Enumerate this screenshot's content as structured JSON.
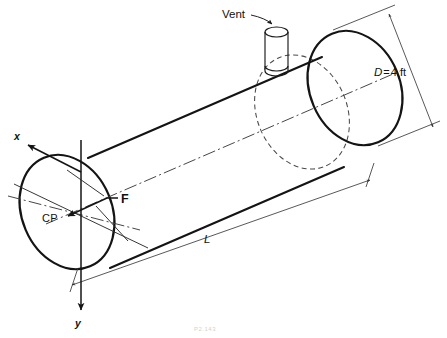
{
  "figure": {
    "kind": "engineering-diagram",
    "background_color": "#ffffff",
    "line_color": "#141414",
    "caption": "P2.143"
  },
  "labels": {
    "vent": "Vent",
    "diameter": "D=4 ft",
    "diameter_symbol": "D",
    "diameter_value": "4 ft",
    "length": "L",
    "center_of_pressure": "CP",
    "force": "F",
    "axis_x": "x",
    "axis_y": "y"
  },
  "annotations": [
    {
      "name": "vent",
      "text": "Vent",
      "kind": "leader-label"
    },
    {
      "name": "diameter-dimension",
      "text": "D=4 ft",
      "kind": "dimension"
    },
    {
      "name": "length-dimension",
      "text": "L",
      "kind": "dimension"
    },
    {
      "name": "center-of-pressure",
      "text": "CP",
      "kind": "point-label"
    },
    {
      "name": "force-vector",
      "text": "F",
      "kind": "vector-label"
    },
    {
      "name": "x-axis",
      "text": "x",
      "kind": "axis-label"
    },
    {
      "name": "y-axis",
      "text": "y",
      "kind": "axis-label"
    }
  ],
  "geometry": {
    "left_end_center": [
      67,
      212
    ],
    "right_end_center": [
      355,
      88
    ],
    "ellipse_rx": 45,
    "ellipse_ry": 59,
    "tilt_degrees": -23
  }
}
